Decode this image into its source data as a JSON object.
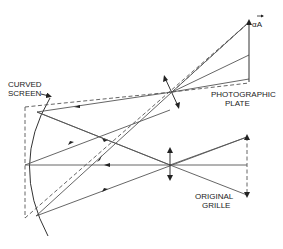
{
  "diagram": {
    "type": "optical-ray-diagram",
    "labels": {
      "curved_screen_line1": "CURVED",
      "curved_screen_line2": "SCREEN",
      "photographic_plate_line1": "PHOTOGRAPHIC",
      "photographic_plate_line2": "PLATE",
      "original_grille_line1": "ORIGINAL",
      "original_grille_line2": "GRILLE",
      "magnified_image": "αA"
    },
    "components": [
      {
        "id": "curved-screen",
        "label": "CURVED SCREEN"
      },
      {
        "id": "projection-lens",
        "label": ""
      },
      {
        "id": "camera-lens",
        "label": ""
      },
      {
        "id": "photographic-plate",
        "label": "PHOTOGRAPHIC PLATE"
      },
      {
        "id": "original-grille",
        "label": "ORIGINAL GRILLE"
      }
    ]
  }
}
